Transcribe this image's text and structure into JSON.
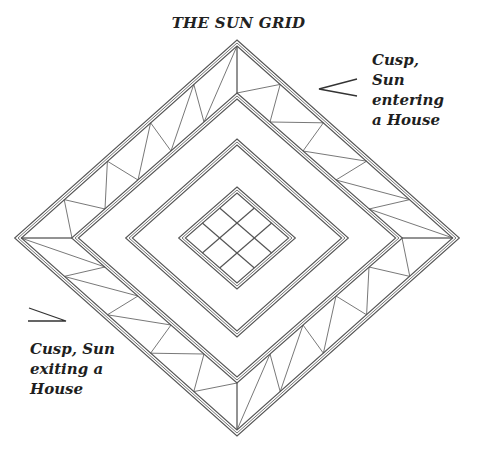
{
  "title": "THE SUN GRID",
  "annotations": {
    "entering": {
      "lines": [
        "Cusp,",
        "Sun",
        "entering",
        "a House"
      ],
      "arrow": "open-angle-pointing-left"
    },
    "exiting": {
      "lines": [
        "Cusp, Sun",
        "exiting a",
        "House"
      ],
      "arrow": "open-angle-pointing-right"
    }
  },
  "diagram": {
    "center": [
      237,
      238
    ],
    "diamonds": [
      {
        "name": "outer",
        "hx": 219,
        "hy": 195
      },
      {
        "name": "second",
        "hx": 162,
        "hy": 142
      },
      {
        "name": "third",
        "hx": 108,
        "hy": 96
      },
      {
        "name": "center",
        "hx": 55,
        "hy": 48
      }
    ],
    "band_segments_per_edge": 5,
    "center_grid": "3x3",
    "line_color": "#555555"
  }
}
